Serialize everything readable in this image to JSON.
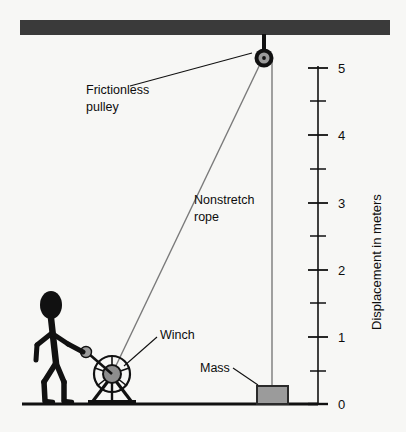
{
  "diagram": {
    "background_color": "#f7f7f5",
    "ink_color": "#111111",
    "structure_color": "#3a3a3a",
    "metal_fill": "#9b9b9b",
    "rope_color": "#6f6f6f"
  },
  "labels": {
    "pulley_line1": "Frictionless",
    "pulley_line2": "pulley",
    "rope_line1": "Nonstretch",
    "rope_line2": "rope",
    "winch": "Winch",
    "mass": "Mass"
  },
  "scale": {
    "axis_title": "Displacement in meters",
    "unit": "meters",
    "min": 0,
    "max": 5,
    "major_step": 1,
    "minor_step": 0.5,
    "major_ticks": [
      {
        "value": "5"
      },
      {
        "value": "4"
      },
      {
        "value": "3"
      },
      {
        "value": "2"
      },
      {
        "value": "1"
      },
      {
        "value": "0"
      }
    ],
    "minor_ticks": [
      "4.5",
      "3.5",
      "2.5",
      "1.5",
      "0.5"
    ]
  },
  "elements": {
    "ceiling": "ceiling-beam",
    "ground": "ground-line",
    "pulley": "frictionless-pulley",
    "winch": "winch-wheel",
    "mass": "mass-block",
    "person": "stick-figure-operator",
    "rope_segment_incline": "rope-winch-to-pulley",
    "rope_segment_vertical": "rope-pulley-to-mass"
  }
}
